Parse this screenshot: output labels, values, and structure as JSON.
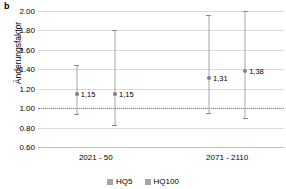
{
  "panel": {
    "label": "b"
  },
  "chart_data": {
    "type": "scatter",
    "title": "",
    "xlabel": "",
    "ylabel": "Änderungsfaktor",
    "ylim": [
      0.6,
      2.0
    ],
    "ytick_step": 0.2,
    "yticks": [
      "0.60",
      "0.80",
      "1.00",
      "1.20",
      "1.40",
      "1.60",
      "1.80",
      "2.00"
    ],
    "ytick_values": [
      0.6,
      0.8,
      1.0,
      1.2,
      1.4,
      1.6,
      1.8,
      2.0
    ],
    "grid": true,
    "reference_line": {
      "value": 1.0,
      "style": "dotted"
    },
    "categories": [
      "2021 - 50",
      "2071 - 2110"
    ],
    "legend_position": "bottom",
    "legend": [
      {
        "name": "HQ5",
        "color": "#a6a6a6"
      },
      {
        "name": "HQ100",
        "color": "#a6a6a6"
      }
    ],
    "series": [
      {
        "name": "HQ5",
        "values": [
          1.15,
          1.31
        ],
        "labels": [
          "1,15",
          "1,31"
        ],
        "lower": [
          0.93,
          0.94
        ],
        "upper": [
          1.44,
          1.96
        ]
      },
      {
        "name": "HQ100",
        "values": [
          1.15,
          1.38
        ],
        "labels": [
          "1,15",
          "1,38"
        ],
        "lower": [
          0.82,
          0.89
        ],
        "upper": [
          1.8,
          2.0
        ]
      }
    ],
    "points": [
      {
        "series": "HQ5",
        "category": "2021 - 50",
        "value": 1.15,
        "label": "1,15",
        "lower": 0.93,
        "upper": 1.44,
        "x_frac": 0.158
      },
      {
        "series": "HQ100",
        "category": "2021 - 50",
        "value": 1.15,
        "label": "1,15",
        "lower": 0.82,
        "upper": 1.8,
        "x_frac": 0.313
      },
      {
        "series": "HQ5",
        "category": "2071 - 2110",
        "value": 1.31,
        "label": "1,31",
        "lower": 0.94,
        "upper": 1.96,
        "x_frac": 0.695
      },
      {
        "series": "HQ100",
        "category": "2071 - 2110",
        "value": 1.38,
        "label": "1,38",
        "lower": 0.89,
        "upper": 2.0,
        "x_frac": 0.842
      }
    ],
    "category_x_frac": [
      0.235,
      0.769
    ]
  }
}
